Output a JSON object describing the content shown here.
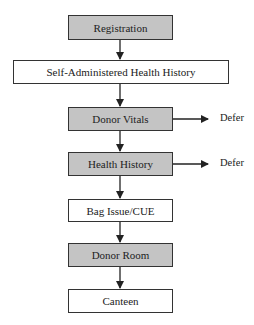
{
  "diagram": {
    "type": "flowchart",
    "steps": [
      {
        "label": "Registration",
        "fill": "gray"
      },
      {
        "label": "Self-Administered Health History",
        "fill": "white"
      },
      {
        "label": "Donor Vitals",
        "fill": "gray",
        "branch": "Defer"
      },
      {
        "label": "Health History",
        "fill": "gray",
        "branch": "Defer"
      },
      {
        "label": "Bag Issue/CUE",
        "fill": "white"
      },
      {
        "label": "Donor Room",
        "fill": "gray"
      },
      {
        "label": "Canteen",
        "fill": "white"
      }
    ],
    "colors": {
      "gray_fill": "#c4c4c4",
      "white_fill": "#ffffff",
      "stroke": "#333333"
    }
  }
}
